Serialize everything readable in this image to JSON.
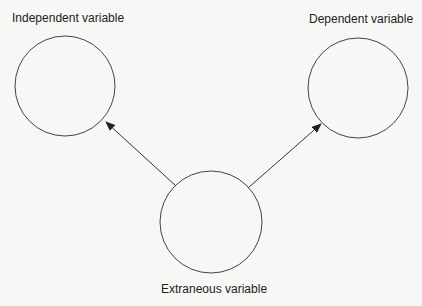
{
  "diagram": {
    "nodes": [
      {
        "id": "independent",
        "label": "Independent variable"
      },
      {
        "id": "dependent",
        "label": "Dependent variable"
      },
      {
        "id": "extraneous",
        "label": "Extraneous variable"
      }
    ],
    "edges": [
      {
        "from": "extraneous",
        "to": "independent"
      },
      {
        "from": "extraneous",
        "to": "dependent"
      }
    ],
    "colors": {
      "line": "#333333",
      "background": "#f7f7f5"
    }
  }
}
